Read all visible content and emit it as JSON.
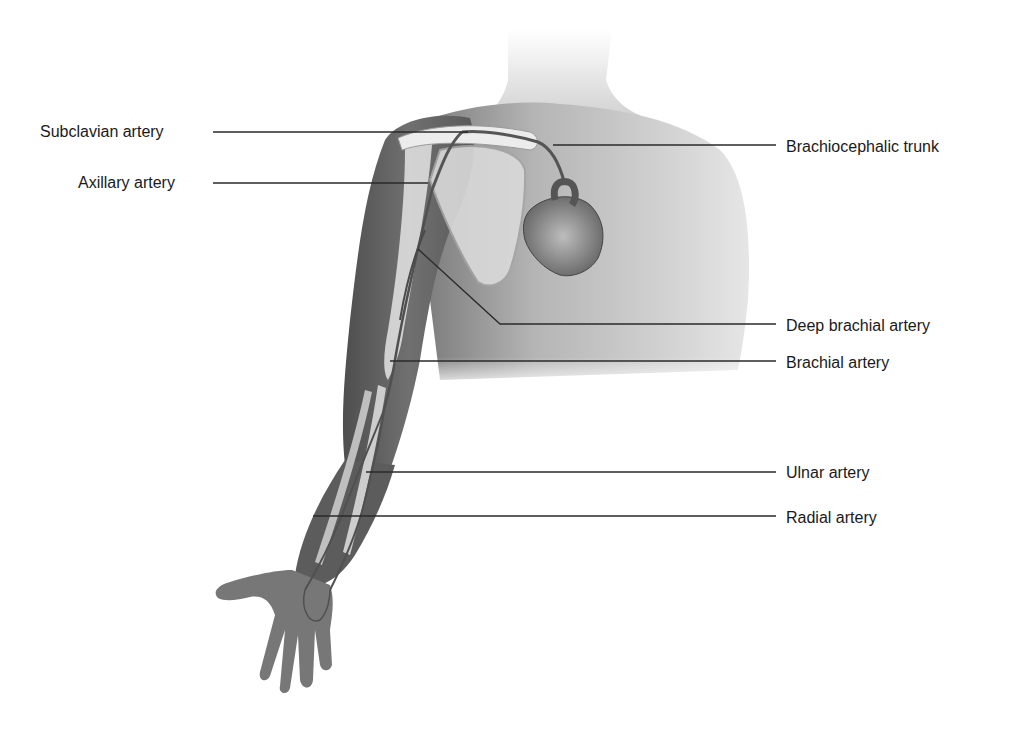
{
  "diagram": {
    "labels_left": [
      {
        "id": "subclavian",
        "text": "Subclavian artery"
      },
      {
        "id": "axillary",
        "text": "Axillary artery"
      }
    ],
    "labels_right": [
      {
        "id": "brachiocephalic",
        "text": "Brachiocephalic trunk"
      },
      {
        "id": "deep-brachial",
        "text": "Deep brachial artery"
      },
      {
        "id": "brachial",
        "text": "Brachial artery"
      },
      {
        "id": "ulnar",
        "text": "Ulnar artery"
      },
      {
        "id": "radial",
        "text": "Radial artery"
      }
    ],
    "colors": {
      "background": "#ffffff",
      "label_text": "#1a1a1a",
      "leader_line": "#2a2a2a",
      "skin_dark": "#6b6b6b",
      "skin_light": "#d9d9d9",
      "bone": "#e8e8e8",
      "artery": "#4a4a4a"
    }
  }
}
